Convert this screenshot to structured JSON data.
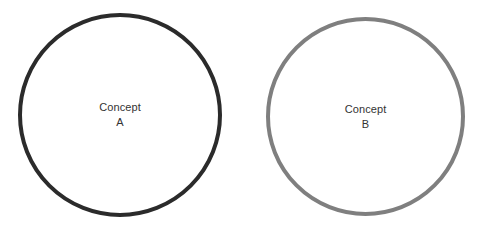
{
  "canvas": {
    "width": 489,
    "height": 228,
    "background_color": "#ffffff"
  },
  "diagram": {
    "type": "two-circle-concept-diagram",
    "shapes": [
      {
        "id": "circle-a",
        "shape": "circle",
        "label_line_1": "Concept",
        "label_line_2": "A",
        "stroke_color": "#2b2b2b",
        "fill_color": "none",
        "stroke_width_px": 4,
        "center_x": 120,
        "center_y": 115,
        "diameter_px": 204
      },
      {
        "id": "circle-b",
        "shape": "circle",
        "label_line_1": "Concept",
        "label_line_2": "B",
        "stroke_color": "#7f7f7f",
        "fill_color": "none",
        "stroke_width_px": 4,
        "center_x": 365,
        "center_y": 116,
        "diameter_px": 199
      }
    ],
    "label_text_color": "#333333"
  }
}
